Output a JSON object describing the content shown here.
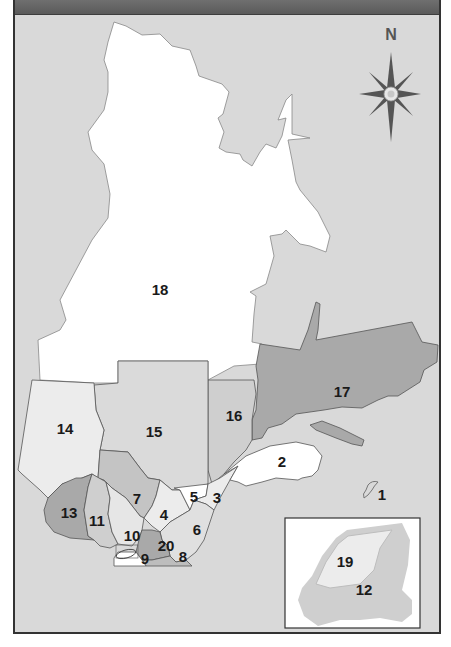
{
  "map": {
    "type": "administrative regions map",
    "compass": {
      "label": "N"
    },
    "colors": {
      "background": "#d9d9d9",
      "header_bar": "#646464",
      "white_region": "#ffffff",
      "light_region": "#ececec",
      "mid_region": "#cfcfcf",
      "dark_region": "#a9a9a9",
      "border": "#555555"
    },
    "regions": [
      {
        "id": "1",
        "label": "1"
      },
      {
        "id": "2",
        "label": "2"
      },
      {
        "id": "3",
        "label": "3"
      },
      {
        "id": "4",
        "label": "4"
      },
      {
        "id": "5",
        "label": "5"
      },
      {
        "id": "6",
        "label": "6"
      },
      {
        "id": "7",
        "label": "7"
      },
      {
        "id": "8",
        "label": "8"
      },
      {
        "id": "9",
        "label": "9"
      },
      {
        "id": "10",
        "label": "10"
      },
      {
        "id": "11",
        "label": "11"
      },
      {
        "id": "12",
        "label": "12"
      },
      {
        "id": "13",
        "label": "13"
      },
      {
        "id": "14",
        "label": "14"
      },
      {
        "id": "15",
        "label": "15"
      },
      {
        "id": "16",
        "label": "16"
      },
      {
        "id": "17",
        "label": "17"
      },
      {
        "id": "18",
        "label": "18"
      },
      {
        "id": "19",
        "label": "19"
      },
      {
        "id": "20",
        "label": "20"
      }
    ],
    "inset": {
      "labels": [
        "19",
        "12"
      ]
    }
  }
}
